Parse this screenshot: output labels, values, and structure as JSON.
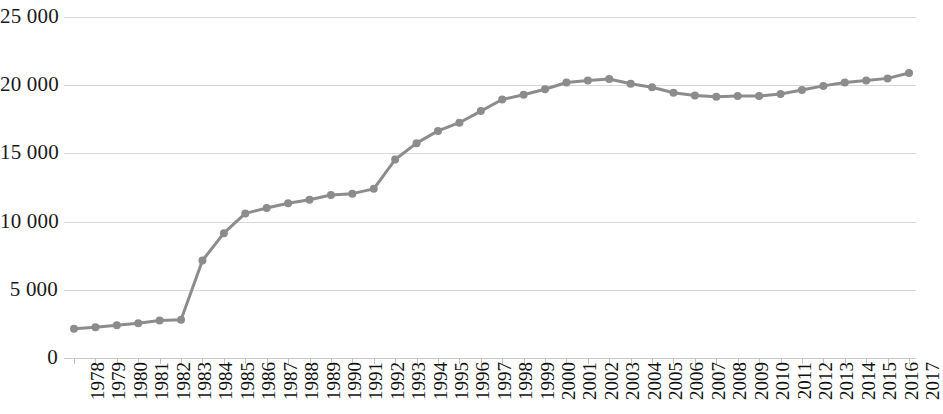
{
  "chart_data": {
    "type": "line",
    "title": "",
    "subtitle": "",
    "xlabel": "",
    "ylabel": "",
    "ylim": [
      0,
      25000
    ],
    "yticks": [
      0,
      5000,
      10000,
      15000,
      20000,
      25000
    ],
    "ytick_labels": [
      "0",
      "5 000",
      "10 000",
      "15 000",
      "20 000",
      "25 000"
    ],
    "grid": true,
    "legend": "none",
    "marker": "circle",
    "line_color": "#8c8c8c",
    "marker_color": "#8c8c8c",
    "grid_color": "#d8d8d8",
    "categories": [
      "1978",
      "1979",
      "1980",
      "1981",
      "1982",
      "1983",
      "1984",
      "1985",
      "1986",
      "1987",
      "1988",
      "1989",
      "1990",
      "1991",
      "1992",
      "1993",
      "1994",
      "1995",
      "1996",
      "1997",
      "1998",
      "1999",
      "2000",
      "2001",
      "2002",
      "2003",
      "2004",
      "2005",
      "2006",
      "2007",
      "2008",
      "2009",
      "2010",
      "2011",
      "2012",
      "2013",
      "2014",
      "2015",
      "2016",
      "2017"
    ],
    "values": [
      2150,
      2250,
      2400,
      2550,
      2750,
      2800,
      7150,
      9150,
      10600,
      11000,
      11350,
      11600,
      11950,
      12050,
      12400,
      14550,
      15750,
      16650,
      17250,
      18100,
      18950,
      19300,
      19700,
      20200,
      20350,
      20450,
      20100,
      19850,
      19450,
      19250,
      19150,
      19200,
      19200,
      19350,
      19650,
      19950,
      20200,
      20350,
      20500,
      20900
    ]
  }
}
